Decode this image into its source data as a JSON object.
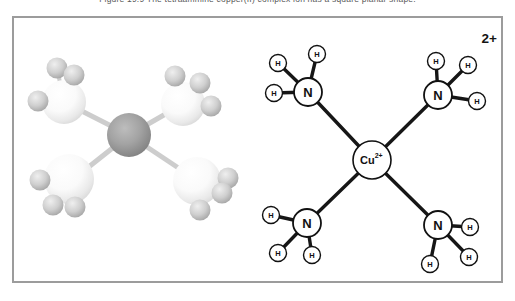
{
  "caption": {
    "text": "Figure 19.9  The tetraammine copper(II) complex ion has a square planar shape."
  },
  "model3d": {
    "stick_color": "#cdcdcd",
    "bonds": [
      {
        "x1": 129,
        "y1": 135,
        "x2": 64,
        "y2": 102,
        "w": 5
      },
      {
        "x1": 129,
        "y1": 135,
        "x2": 183,
        "y2": 104,
        "w": 5
      },
      {
        "x1": 129,
        "y1": 135,
        "x2": 71,
        "y2": 181,
        "w": 5
      },
      {
        "x1": 129,
        "y1": 135,
        "x2": 198,
        "y2": 181,
        "w": 5
      },
      {
        "x1": 64,
        "y1": 102,
        "x2": 57,
        "y2": 68,
        "w": 4
      },
      {
        "x1": 64,
        "y1": 102,
        "x2": 74,
        "y2": 75,
        "w": 4
      },
      {
        "x1": 64,
        "y1": 102,
        "x2": 38,
        "y2": 101,
        "w": 4
      },
      {
        "x1": 183,
        "y1": 104,
        "x2": 175,
        "y2": 76,
        "w": 4
      },
      {
        "x1": 183,
        "y1": 104,
        "x2": 200,
        "y2": 83,
        "w": 4
      },
      {
        "x1": 183,
        "y1": 104,
        "x2": 211,
        "y2": 106,
        "w": 4
      },
      {
        "x1": 69,
        "y1": 179,
        "x2": 40,
        "y2": 180,
        "w": 4
      },
      {
        "x1": 69,
        "y1": 179,
        "x2": 53,
        "y2": 205,
        "w": 4
      },
      {
        "x1": 69,
        "y1": 179,
        "x2": 75,
        "y2": 207,
        "w": 4
      },
      {
        "x1": 197,
        "y1": 181,
        "x2": 228,
        "y2": 178,
        "w": 4
      },
      {
        "x1": 197,
        "y1": 181,
        "x2": 222,
        "y2": 193,
        "w": 4
      },
      {
        "x1": 197,
        "y1": 181,
        "x2": 200,
        "y2": 210,
        "w": 4
      }
    ],
    "spheres": [
      {
        "kind": "n",
        "x": 64,
        "y": 102,
        "r": 22
      },
      {
        "kind": "n",
        "x": 183,
        "y": 104,
        "r": 22
      },
      {
        "kind": "n",
        "x": 69,
        "y": 179,
        "r": 25
      },
      {
        "kind": "n",
        "x": 197,
        "y": 181,
        "r": 24
      },
      {
        "kind": "cu",
        "x": 129,
        "y": 135,
        "r": 22
      },
      {
        "kind": "h",
        "x": 57,
        "y": 68,
        "r": 10.5
      },
      {
        "kind": "h",
        "x": 74,
        "y": 75,
        "r": 10.5
      },
      {
        "kind": "h",
        "x": 38,
        "y": 101,
        "r": 10.5
      },
      {
        "kind": "h",
        "x": 175,
        "y": 76,
        "r": 10.5
      },
      {
        "kind": "h",
        "x": 200,
        "y": 83,
        "r": 10.5
      },
      {
        "kind": "h",
        "x": 211,
        "y": 106,
        "r": 10.5
      },
      {
        "kind": "h",
        "x": 40,
        "y": 180,
        "r": 10.5
      },
      {
        "kind": "h",
        "x": 53,
        "y": 205,
        "r": 10.5
      },
      {
        "kind": "h",
        "x": 75,
        "y": 207,
        "r": 10.5
      },
      {
        "kind": "h",
        "x": 228,
        "y": 178,
        "r": 10.5
      },
      {
        "kind": "h",
        "x": 222,
        "y": 193,
        "r": 10.5
      },
      {
        "kind": "h",
        "x": 200,
        "y": 210,
        "r": 10.5
      }
    ]
  },
  "diagram": {
    "overall_charge": "2+",
    "bond_color": "#161616",
    "bond_width": 3.4,
    "center_atom": {
      "symbol": "Cu",
      "charge": "2+",
      "x": 372,
      "y": 160,
      "r": 19
    },
    "n_atoms": [
      {
        "symbol": "N",
        "x": 308,
        "y": 92,
        "r": 14
      },
      {
        "symbol": "N",
        "x": 438,
        "y": 95,
        "r": 14
      },
      {
        "symbol": "N",
        "x": 307,
        "y": 223,
        "r": 14
      },
      {
        "symbol": "N",
        "x": 438,
        "y": 225,
        "r": 14
      }
    ],
    "h_atoms": [
      {
        "symbol": "H",
        "x": 317,
        "y": 54,
        "r": 8.5
      },
      {
        "symbol": "H",
        "x": 278,
        "y": 63,
        "r": 8.5
      },
      {
        "symbol": "H",
        "x": 274,
        "y": 93,
        "r": 8.5
      },
      {
        "symbol": "H",
        "x": 436,
        "y": 61,
        "r": 8.5
      },
      {
        "symbol": "H",
        "x": 468,
        "y": 65,
        "r": 8.5
      },
      {
        "symbol": "H",
        "x": 477,
        "y": 101,
        "r": 8.5
      },
      {
        "symbol": "H",
        "x": 271,
        "y": 215,
        "r": 8.5
      },
      {
        "symbol": "H",
        "x": 278,
        "y": 253,
        "r": 8.5
      },
      {
        "symbol": "H",
        "x": 312,
        "y": 255,
        "r": 8.5
      },
      {
        "symbol": "H",
        "x": 470,
        "y": 227,
        "r": 8.5
      },
      {
        "symbol": "H",
        "x": 469,
        "y": 257,
        "r": 8.5
      },
      {
        "symbol": "H",
        "x": 430,
        "y": 264,
        "r": 8.5
      }
    ],
    "bonds": [
      {
        "x1": 372,
        "y1": 160,
        "x2": 308,
        "y2": 92
      },
      {
        "x1": 372,
        "y1": 160,
        "x2": 438,
        "y2": 95
      },
      {
        "x1": 372,
        "y1": 160,
        "x2": 307,
        "y2": 223
      },
      {
        "x1": 372,
        "y1": 160,
        "x2": 438,
        "y2": 225
      },
      {
        "x1": 308,
        "y1": 92,
        "x2": 317,
        "y2": 54
      },
      {
        "x1": 308,
        "y1": 92,
        "x2": 278,
        "y2": 63
      },
      {
        "x1": 308,
        "y1": 92,
        "x2": 274,
        "y2": 93
      },
      {
        "x1": 438,
        "y1": 95,
        "x2": 436,
        "y2": 61
      },
      {
        "x1": 438,
        "y1": 95,
        "x2": 468,
        "y2": 65
      },
      {
        "x1": 438,
        "y1": 95,
        "x2": 477,
        "y2": 101
      },
      {
        "x1": 307,
        "y1": 223,
        "x2": 271,
        "y2": 215
      },
      {
        "x1": 307,
        "y1": 223,
        "x2": 278,
        "y2": 253
      },
      {
        "x1": 307,
        "y1": 223,
        "x2": 312,
        "y2": 255
      },
      {
        "x1": 438,
        "y1": 225,
        "x2": 470,
        "y2": 227
      },
      {
        "x1": 438,
        "y1": 225,
        "x2": 469,
        "y2": 257
      },
      {
        "x1": 438,
        "y1": 225,
        "x2": 430,
        "y2": 264
      }
    ]
  }
}
